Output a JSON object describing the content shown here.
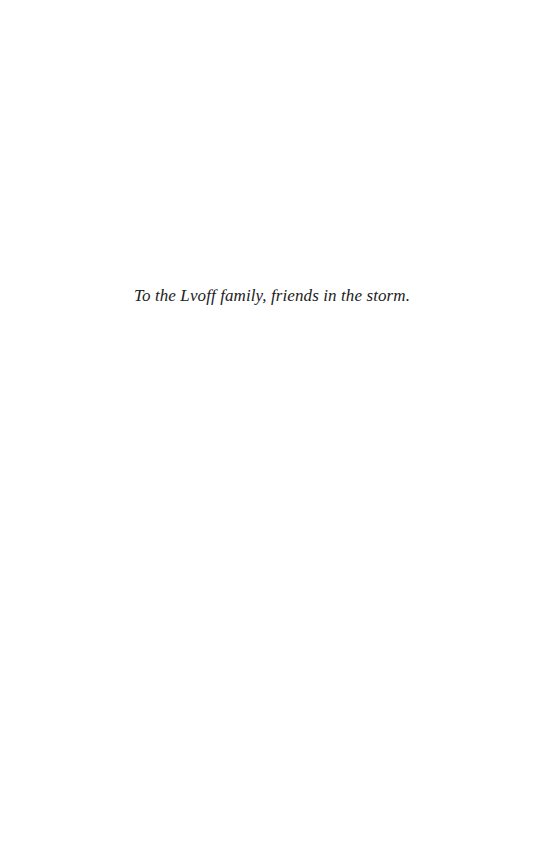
{
  "page": {
    "type": "dedication",
    "background_color": "#ffffff",
    "text_color": "#222222"
  },
  "dedication": {
    "text": "To the Lvoff family, friends in the storm."
  }
}
